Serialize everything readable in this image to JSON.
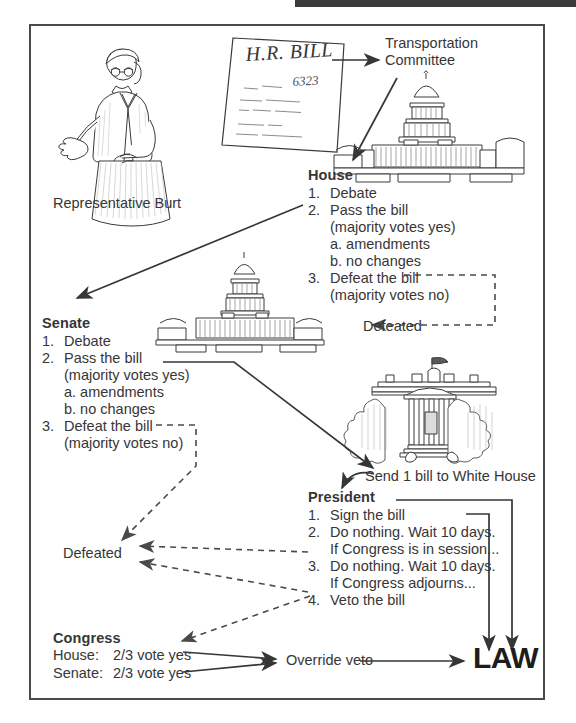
{
  "figure": {
    "type": "flowchart"
  },
  "actors": {
    "representative_caption": "Representative Burt",
    "bill_title": "H.R. BILL",
    "bill_number": "6323",
    "committee": {
      "line1": "Transportation",
      "line2": "Committee"
    }
  },
  "house": {
    "heading": "House",
    "steps": [
      {
        "num": "1.",
        "text": "Debate"
      },
      {
        "num": "2.",
        "text": "Pass the bill"
      },
      {
        "num": "",
        "text": "(majority votes yes)"
      },
      {
        "num": "",
        "text": "a. amendments"
      },
      {
        "num": "",
        "text": "b. no changes"
      },
      {
        "num": "3.",
        "text": "Defeat the bill"
      },
      {
        "num": "",
        "text": "(majority votes no)"
      }
    ],
    "defeated_label": "Defeated"
  },
  "senate": {
    "heading": "Senate",
    "steps": [
      {
        "num": "1.",
        "text": "Debate"
      },
      {
        "num": "2.",
        "text": "Pass the bill"
      },
      {
        "num": "",
        "text": "(majority votes yes)"
      },
      {
        "num": "",
        "text": "a. amendments"
      },
      {
        "num": "",
        "text": "b. no changes"
      },
      {
        "num": "3.",
        "text": "Defeat the bill"
      },
      {
        "num": "",
        "text": "(majority votes no)"
      }
    ],
    "defeated_label": "Defeated"
  },
  "white_house": {
    "send_label": "Send 1 bill to White House"
  },
  "president": {
    "heading": "President",
    "steps": [
      {
        "num": "1.",
        "text": "Sign the bill"
      },
      {
        "num": "2.",
        "text": "Do nothing. Wait 10 days."
      },
      {
        "num": "",
        "text": "If Congress is in session..."
      },
      {
        "num": "3.",
        "text": "Do nothing. Wait 10 days."
      },
      {
        "num": "",
        "text": "If Congress adjourns..."
      },
      {
        "num": "4.",
        "text": "Veto the bill"
      }
    ]
  },
  "congress": {
    "heading": "Congress",
    "rows": [
      {
        "chamber": "House:",
        "requirement": "2/3 vote yes"
      },
      {
        "chamber": "Senate:",
        "requirement": "2/3 vote yes"
      }
    ],
    "override_label": "Override veto",
    "law_label": "LAW"
  },
  "colors": {
    "ink": "#363636",
    "frame": "#4a4a4a",
    "bar": "#3a3a3a"
  }
}
